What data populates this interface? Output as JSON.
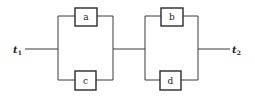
{
  "diagram": {
    "type": "series-parallel network",
    "terminals": {
      "input": {
        "label": "t",
        "sub": "1"
      },
      "output": {
        "label": "t",
        "sub": "2"
      }
    },
    "blocks": [
      {
        "name": "parallel-block-1",
        "components": [
          "a",
          "c"
        ]
      },
      {
        "name": "parallel-block-2",
        "components": [
          "b",
          "d"
        ]
      }
    ],
    "components": {
      "a": "a",
      "b": "b",
      "c": "c",
      "d": "d"
    },
    "connections": [
      [
        "t1",
        "a"
      ],
      [
        "t1",
        "c"
      ],
      [
        "a",
        "b"
      ],
      [
        "a",
        "d"
      ],
      [
        "c",
        "b"
      ],
      [
        "c",
        "d"
      ],
      [
        "b",
        "t2"
      ],
      [
        "d",
        "t2"
      ]
    ]
  }
}
